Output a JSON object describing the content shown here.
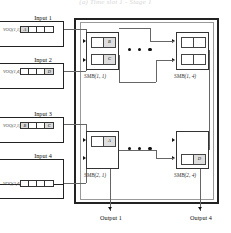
{
  "figure": {
    "caption_top": "(a) Time slot 1 - Stage 1",
    "type": "switch-architecture-diagram"
  },
  "inputs": [
    {
      "label": "Input 1",
      "voq_label": "VOQ(1,1)",
      "cells": [
        {
          "text": "A",
          "filled": true
        },
        {
          "text": "",
          "filled": false
        },
        {
          "text": "",
          "filled": false
        },
        {
          "text": "",
          "filled": false
        }
      ]
    },
    {
      "label": "Input 2",
      "voq_label": "VOQ(1,4)",
      "cells": [
        {
          "text": "",
          "filled": false
        },
        {
          "text": "",
          "filled": false
        },
        {
          "text": "",
          "filled": false
        },
        {
          "text": "D",
          "filled": true
        }
      ]
    },
    {
      "label": "Input 3",
      "voq_label": "VOQ(2,1)",
      "cells": [
        {
          "text": "B",
          "filled": true
        },
        {
          "text": "",
          "filled": false
        },
        {
          "text": "",
          "filled": false
        },
        {
          "text": "C",
          "filled": true
        }
      ]
    },
    {
      "label": "Input 4",
      "voq_label": "VOQ(2,4)",
      "cells": [
        {
          "text": "",
          "filled": false
        },
        {
          "text": "",
          "filled": false
        },
        {
          "text": "",
          "filled": false
        },
        {
          "text": "",
          "filled": false
        }
      ]
    }
  ],
  "smbs": [
    {
      "label": "SMB(1, 1)",
      "slots": [
        {
          "left": "",
          "right": "B",
          "left_filled": false,
          "right_filled": true
        },
        {
          "left": "",
          "right": "C",
          "left_filled": false,
          "right_filled": true
        }
      ]
    },
    {
      "label": "SMB(1, 4)",
      "slots": [
        {
          "left": "",
          "right": "",
          "left_filled": false,
          "right_filled": false
        },
        {
          "left": "",
          "right": "",
          "left_filled": false,
          "right_filled": false
        }
      ]
    },
    {
      "label": "SMB(2, 1)",
      "slots": [
        {
          "left": "",
          "right": "A",
          "left_filled": false,
          "right_filled": true
        }
      ]
    },
    {
      "label": "SMB(2, 4)",
      "slots": [
        {
          "left": "",
          "right": "D",
          "left_filled": false,
          "right_filled": true
        }
      ]
    }
  ],
  "outputs": [
    {
      "label": "Output 1"
    },
    {
      "label": "Output 4"
    }
  ],
  "ellipsis": {
    "dot_count": 3,
    "glyph": "ellipsis-dots"
  },
  "colors": {
    "line": "#222222",
    "wire": "#666666",
    "cell_fill": "#d9d9d9",
    "background": "#ffffff"
  }
}
